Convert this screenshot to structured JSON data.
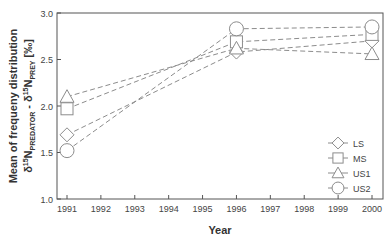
{
  "chart_data": {
    "type": "line",
    "title": "",
    "xlabel": "Year",
    "ylabel_line1": "Mean of frequeny distribution",
    "ylabel_line2": "δ15N PREDATOR - δ15N PREY [‰]",
    "ylabel": "Mean of frequeny distribution δ15N_PREDATOR - δ15N_PREY [‰]",
    "x": [
      1991,
      1996,
      2000
    ],
    "xticks": [
      "1991",
      "1992",
      "1993",
      "1994",
      "1995",
      "1996",
      "1997",
      "1998",
      "1999",
      "2000"
    ],
    "xlim": [
      1991,
      2000
    ],
    "yticks": [
      "1.0",
      "1.5",
      "2.0",
      "2.5",
      "3.0"
    ],
    "ylim": [
      1.0,
      3.0
    ],
    "grid": false,
    "legend_position": "lower right",
    "series": [
      {
        "name": "LS",
        "marker": "diamond",
        "values": [
          1.69,
          2.58,
          2.7
        ]
      },
      {
        "name": "MS",
        "marker": "square",
        "values": [
          1.97,
          2.69,
          2.77
        ]
      },
      {
        "name": "US1",
        "marker": "triangle",
        "values": [
          2.1,
          2.62,
          2.56
        ]
      },
      {
        "name": "US2",
        "marker": "circle",
        "values": [
          1.52,
          2.83,
          2.85
        ]
      }
    ],
    "line_style": "dashed",
    "colors": {
      "line": "#8c8c8c",
      "marker": "#8c8c8c",
      "axis": "#555555",
      "text": "#444444"
    }
  }
}
